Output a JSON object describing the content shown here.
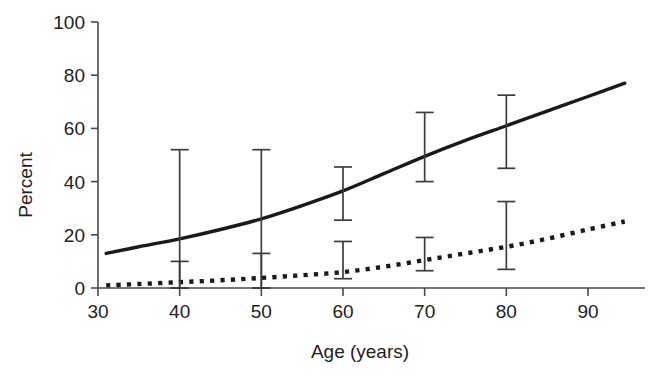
{
  "chart_data": {
    "type": "line",
    "title": "",
    "subtitle": "",
    "xlabel": "Age (years)",
    "ylabel": "Percent",
    "xlim": [
      30,
      96
    ],
    "ylim": [
      0,
      100
    ],
    "grid": false,
    "legend_position": "none",
    "x_ticks": [
      30,
      40,
      50,
      60,
      70,
      80,
      90
    ],
    "x_tick_labels": [
      "30",
      "40",
      "50",
      "60",
      "70",
      "80",
      "90"
    ],
    "y_ticks": [
      0,
      20,
      40,
      60,
      80,
      100
    ],
    "y_tick_labels": [
      "0",
      "20",
      "40",
      "60",
      "80",
      "100"
    ],
    "series": [
      {
        "name": "solid-curve",
        "style": "solid",
        "color": "#1a1a1a",
        "x": [
          31,
          35,
          40,
          45,
          50,
          55,
          60,
          65,
          70,
          75,
          80,
          85,
          90,
          94.5
        ],
        "values": [
          13.0,
          15.5,
          18.5,
          22.0,
          26.0,
          31.0,
          36.5,
          43.0,
          49.5,
          55.5,
          61.0,
          66.5,
          72.0,
          77.0
        ],
        "error_bars": [
          {
            "x": 40,
            "y": 18.5,
            "low": 0.0,
            "high": 52.0
          },
          {
            "x": 50,
            "y": 26.0,
            "low": 0.0,
            "high": 52.0
          },
          {
            "x": 60,
            "y": 36.5,
            "low": 25.5,
            "high": 45.5
          },
          {
            "x": 70,
            "y": 49.5,
            "low": 40.0,
            "high": 66.0
          },
          {
            "x": 80,
            "y": 61.0,
            "low": 45.0,
            "high": 72.5
          }
        ]
      },
      {
        "name": "dotted-curve",
        "style": "dotted",
        "color": "#1a1a1a",
        "x": [
          31,
          35,
          40,
          45,
          50,
          55,
          60,
          65,
          70,
          75,
          80,
          85,
          90,
          94.5
        ],
        "values": [
          1.0,
          1.5,
          2.2,
          2.9,
          3.8,
          4.8,
          6.0,
          8.0,
          10.5,
          13.0,
          15.5,
          18.5,
          22.0,
          25.0
        ],
        "error_bars": [
          {
            "x": 40,
            "y": 2.2,
            "low": 0.0,
            "high": 10.0
          },
          {
            "x": 50,
            "y": 3.8,
            "low": 0.0,
            "high": 13.0
          },
          {
            "x": 60,
            "y": 6.0,
            "low": 3.5,
            "high": 17.5
          },
          {
            "x": 70,
            "y": 10.5,
            "low": 6.5,
            "high": 19.0
          },
          {
            "x": 80,
            "y": 15.5,
            "low": 7.0,
            "high": 32.5
          }
        ]
      }
    ]
  },
  "axes": {
    "x_title": "Age (years)",
    "y_title": "Percent"
  }
}
